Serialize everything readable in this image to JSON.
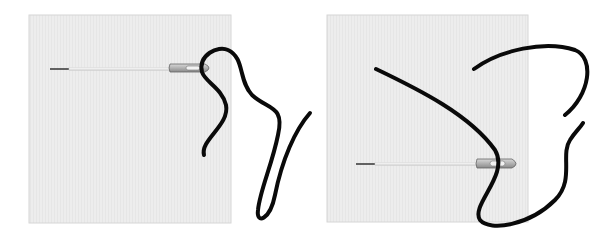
{
  "figure": {
    "background": "#ffffff",
    "fabric_color": "#ececec",
    "fabric_border": "#d8d8d8",
    "thread_color": "#0a0a0a",
    "panels": [
      {
        "id": "left",
        "label": "needle with thread looped through eye"
      },
      {
        "id": "right",
        "label": "needle with thread crossing fabric"
      }
    ]
  }
}
